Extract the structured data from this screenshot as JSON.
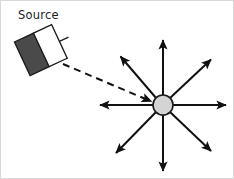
{
  "figure": {
    "width": 234,
    "height": 179,
    "background": "#ffffff",
    "border_color": "#d8d8d8"
  },
  "labels": {
    "source": "Source"
  },
  "source_object": {
    "name": "source-emitter",
    "rotation_deg": -25,
    "dark_panel_color": "#4a4a4a",
    "light_panel_color": "#ffffff",
    "outline_color": "#1a1a1a",
    "center_x": 41,
    "center_y": 48
  },
  "center_dot": {
    "name": "scattering-point",
    "cx": 162,
    "cy": 104,
    "r": 10,
    "fill": "#d4d4d4",
    "stroke": "#1a1a1a",
    "stroke_width": 1.6
  },
  "incident_ray": {
    "name": "incident-dashed-ray",
    "style": "dashed",
    "color": "#111111",
    "from_x": 61,
    "from_y": 62,
    "to_x": 150,
    "to_y": 100,
    "dash_pattern": "7 5"
  },
  "rays": [
    {
      "name": "ray-up",
      "angle_deg": 90,
      "tip_x": 162,
      "tip_y": 36
    },
    {
      "name": "ray-up-right",
      "angle_deg": 45,
      "tip_x": 213,
      "tip_y": 56
    },
    {
      "name": "ray-right",
      "angle_deg": 0,
      "tip_x": 228,
      "tip_y": 104
    },
    {
      "name": "ray-down-right",
      "angle_deg": -45,
      "tip_x": 213,
      "tip_y": 153
    },
    {
      "name": "ray-down",
      "angle_deg": -90,
      "tip_x": 162,
      "tip_y": 173
    },
    {
      "name": "ray-down-left",
      "angle_deg": -135,
      "tip_x": 112,
      "tip_y": 155
    },
    {
      "name": "ray-left",
      "angle_deg": 180,
      "tip_x": 96,
      "tip_y": 104
    },
    {
      "name": "ray-up-left",
      "angle_deg": 135,
      "tip_x": 117,
      "tip_y": 53
    }
  ],
  "ray_style": {
    "color": "#111111",
    "stroke_width": 2.0,
    "arrowhead_length": 9,
    "arrowhead_width": 7
  }
}
